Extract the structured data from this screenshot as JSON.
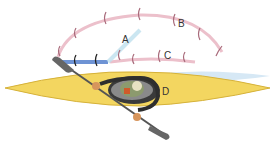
{
  "diagram": {
    "labels": {
      "A": "A",
      "B": "B",
      "C": "C",
      "D": "D"
    },
    "colors": {
      "kayak_hull": "#f2d35a",
      "kayak_outline": "#d9b43a",
      "arc_pink": "#e8b4c0",
      "arc_blue": "#6a8fd0",
      "paddle": "#555555",
      "water": "#cfe3f2",
      "cockpit": "#3a3a3a"
    }
  }
}
